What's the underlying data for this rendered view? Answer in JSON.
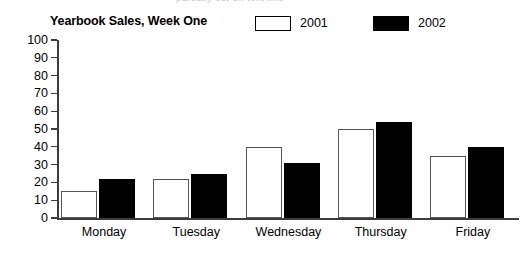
{
  "ghost_text": "partially cut-off text line",
  "header": {
    "title": "Yearbook Sales, Week One"
  },
  "legend": {
    "entries": [
      {
        "label": "2001",
        "swatch": "white"
      },
      {
        "label": "2002",
        "swatch": "black"
      }
    ]
  },
  "axis": {
    "y_ticks": [
      "100",
      "90",
      "80",
      "70",
      "60",
      "50",
      "40",
      "30",
      "20",
      "10",
      "0"
    ]
  },
  "chart_data": {
    "type": "bar",
    "title": "Yearbook Sales, Week One",
    "xlabel": "",
    "ylabel": "",
    "ylim": [
      0,
      100
    ],
    "ytick_step": 10,
    "grid": false,
    "legend_position": "top-right",
    "categories": [
      "Monday",
      "Tuesday",
      "Wednesday",
      "Thursday",
      "Friday"
    ],
    "series": [
      {
        "name": "2001",
        "color": "#ffffff",
        "values": [
          15,
          22,
          40,
          50,
          35
        ]
      },
      {
        "name": "2002",
        "color": "#000000",
        "values": [
          22,
          25,
          31,
          54,
          40
        ]
      }
    ]
  }
}
